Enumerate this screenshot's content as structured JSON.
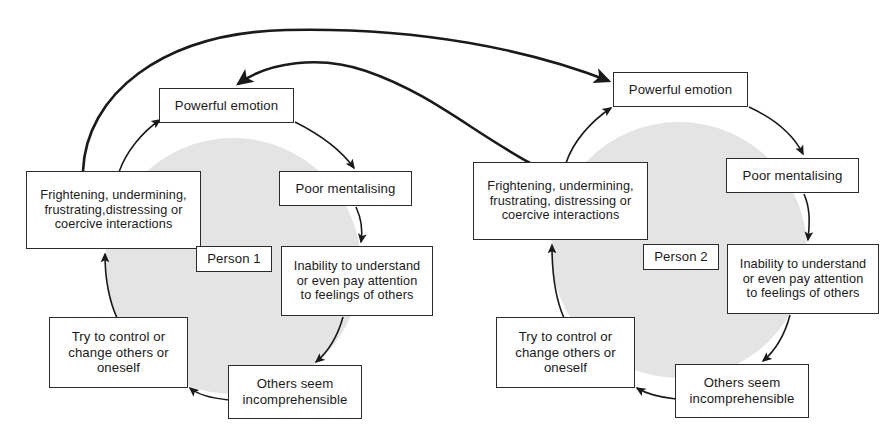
{
  "diagram": {
    "type": "cyclic-flow-diagram",
    "title": "",
    "colors": {
      "circle_fill": "#e4e4e4",
      "box_fill": "#ffffff",
      "box_stroke": "#2b2b2b",
      "arrow_stroke": "#1a1a1a",
      "text": "#1a1a1a",
      "background": "#ffffff"
    },
    "cycles": [
      {
        "id": "person-1",
        "label": "Person 1",
        "circle": {
          "cx": 233,
          "cy": 266,
          "r": 128
        },
        "nodes": [
          {
            "id": "powerful-emotion",
            "text": "Powerful emotion",
            "x": 159,
            "y": 88,
            "w": 135,
            "h": 35
          },
          {
            "id": "poor-mentalising",
            "text": "Poor mentalising",
            "x": 279,
            "y": 171,
            "w": 133,
            "h": 35
          },
          {
            "id": "inability-to-understand",
            "text": "Inability to understand\nor even pay attention\nto feelings of others",
            "x": 281,
            "y": 246,
            "w": 152,
            "h": 70
          },
          {
            "id": "others-seem-incomprehensible",
            "text": "Others seem\nincomprehensible",
            "x": 228,
            "y": 365,
            "w": 134,
            "h": 54
          },
          {
            "id": "try-to-control",
            "text": "Try to control or\nchange others or\noneself",
            "x": 49,
            "y": 317,
            "w": 139,
            "h": 71
          },
          {
            "id": "frightening-interactions",
            "text": "Frightening, undermining,\nfrustrating,distressing or\ncoercive interactions",
            "x": 26,
            "y": 171,
            "w": 175,
            "h": 78
          }
        ]
      },
      {
        "id": "person-2",
        "label": "Person 2",
        "circle": {
          "cx": 679,
          "cy": 250,
          "r": 128
        },
        "nodes": [
          {
            "id": "powerful-emotion",
            "text": "Powerful emotion",
            "x": 613,
            "y": 72,
            "w": 135,
            "h": 35
          },
          {
            "id": "poor-mentalising",
            "text": "Poor mentalising",
            "x": 726,
            "y": 158,
            "w": 133,
            "h": 35
          },
          {
            "id": "inability-to-understand",
            "text": "Inability to understand\nor even pay attention\nto feelings of others",
            "x": 727,
            "y": 244,
            "w": 152,
            "h": 70
          },
          {
            "id": "others-seem-incomprehensible",
            "text": "Others seem\nincomprehensible",
            "x": 675,
            "y": 364,
            "w": 134,
            "h": 54
          },
          {
            "id": "try-to-control",
            "text": "Try to control or\nchange others or\noneself",
            "x": 496,
            "y": 317,
            "w": 139,
            "h": 71
          },
          {
            "id": "frightening-interactions",
            "text": "Frightening, undermining,\nfrustrating, distressing or\ncoercive interactions",
            "x": 473,
            "y": 162,
            "w": 175,
            "h": 78
          }
        ]
      }
    ],
    "cross_links": [
      {
        "id": "p1-to-p2",
        "from": "person-1.frightening-interactions",
        "to": "person-2.powerful-emotion"
      },
      {
        "id": "p2-to-p1",
        "from": "person-2.frightening-interactions",
        "to": "person-1.powerful-emotion"
      }
    ]
  }
}
